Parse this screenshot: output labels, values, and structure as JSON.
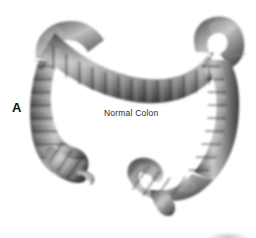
{
  "figure": {
    "panel_letter": "A",
    "organ_label": "Normal Colon",
    "background_color": "#ffffff",
    "label_color": "#2b2b2b",
    "panel_letter_color": "#0d0d0d",
    "illustration_style": "grayscale anatomical illustration",
    "tone_range": {
      "shadow": "#3a3a3a",
      "midtone": "#7d7d7d",
      "highlight": "#d2d2d2"
    },
    "segments": [
      {
        "name": "cecum",
        "icon": "cecum-shape"
      },
      {
        "name": "appendix",
        "icon": "appendix-shape"
      },
      {
        "name": "ascending-colon",
        "icon": "ascending-colon-shape"
      },
      {
        "name": "hepatic-flexure",
        "icon": "hepatic-flexure-shape"
      },
      {
        "name": "transverse-colon",
        "icon": "transverse-colon-shape"
      },
      {
        "name": "splenic-flexure",
        "icon": "splenic-flexure-shape"
      },
      {
        "name": "descending-colon",
        "icon": "descending-colon-shape"
      },
      {
        "name": "sigmoid-colon",
        "icon": "sigmoid-colon-shape"
      },
      {
        "name": "rectum",
        "icon": "rectum-shape"
      }
    ]
  }
}
